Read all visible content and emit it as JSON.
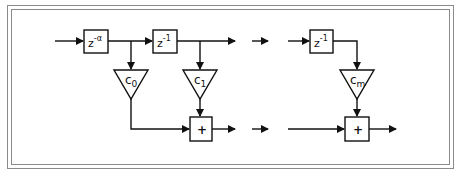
{
  "diagram": {
    "type": "FIR filter block diagram (tapped delay line)",
    "delay_blocks": [
      {
        "id": "delay-alpha",
        "base": "z",
        "exponent": "-α"
      },
      {
        "id": "delay-1",
        "base": "z",
        "exponent": "-1"
      },
      {
        "id": "delay-m",
        "base": "z",
        "exponent": "-1"
      }
    ],
    "gain_blocks": [
      {
        "id": "gain-c0",
        "base": "c",
        "sub": "0"
      },
      {
        "id": "gain-c1",
        "base": "c",
        "sub": "1"
      },
      {
        "id": "gain-cm",
        "base": "c",
        "sub": "m"
      }
    ],
    "adders": [
      {
        "id": "adder-1",
        "symbol": "+"
      },
      {
        "id": "adder-m",
        "symbol": "+"
      }
    ],
    "colors": {
      "stroke": "#111111",
      "frame": "#8a8a8a",
      "background": "#ffffff"
    }
  }
}
